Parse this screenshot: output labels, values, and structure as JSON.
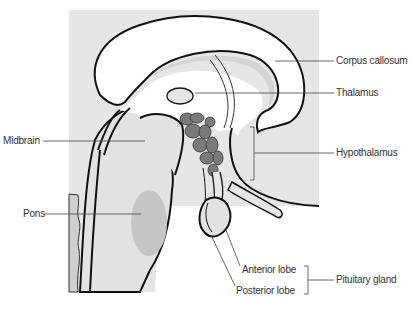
{
  "diagram": {
    "colors": {
      "background": "#ffffff",
      "panel": "#e6e6e6",
      "tissue_white": "#ffffff",
      "tissue_light": "#e2e2e2",
      "pons_shade": "#c8c8c8",
      "nuclei": "#7a7a7a",
      "outline": "#111111",
      "leader": "#444444",
      "text": "#333333"
    },
    "labels": {
      "corpus_callosum": "Corpus callosum",
      "thalamus": "Thalamus",
      "midbrain": "Midbrain",
      "hypothalamus": "Hypothalamus",
      "pons": "Pons",
      "anterior_lobe": "Anterior lobe",
      "posterior_lobe": "Posterior lobe",
      "pituitary_gland": "Pituitary gland"
    }
  }
}
